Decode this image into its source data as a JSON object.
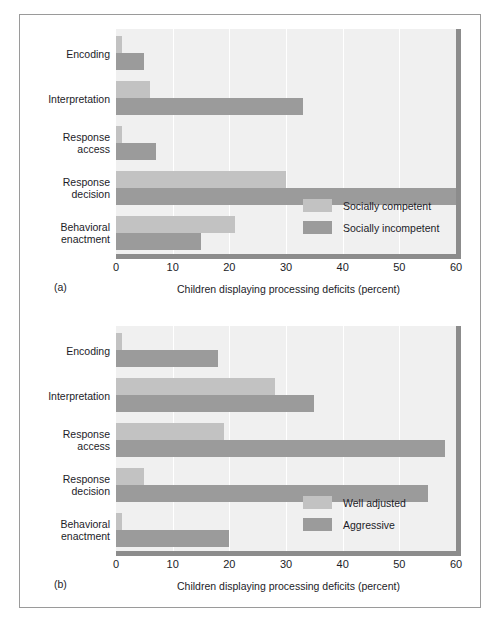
{
  "chart_data": [
    {
      "type": "bar",
      "orientation": "horizontal",
      "panel": "(a)",
      "title": "",
      "xlabel": "Children displaying processing deficits (percent)",
      "ylabel": "",
      "xlim": [
        0,
        60
      ],
      "xticks": [
        0,
        10,
        20,
        30,
        40,
        50,
        60
      ],
      "grid": true,
      "legend_position": "inside-lower-right",
      "categories": [
        "Encoding",
        "Interpretation",
        "Response access",
        "Response decision",
        "Behavioral enactment"
      ],
      "series": [
        {
          "name": "Socially competent",
          "color": "#c2c2c2",
          "values": [
            1,
            6,
            1,
            30,
            21
          ]
        },
        {
          "name": "Socially incompetent",
          "color": "#9b9b9b",
          "values": [
            5,
            33,
            7,
            60,
            15
          ]
        }
      ]
    },
    {
      "type": "bar",
      "orientation": "horizontal",
      "panel": "(b)",
      "title": "",
      "xlabel": "Children displaying processing deficits (percent)",
      "ylabel": "",
      "xlim": [
        0,
        60
      ],
      "xticks": [
        0,
        10,
        20,
        30,
        40,
        50,
        60
      ],
      "grid": true,
      "legend_position": "inside-lower-right",
      "categories": [
        "Encoding",
        "Interpretation",
        "Response access",
        "Response decision",
        "Behavioral enactment"
      ],
      "series": [
        {
          "name": "Well adjusted",
          "color": "#c2c2c2",
          "values": [
            1,
            28,
            19,
            5,
            1
          ]
        },
        {
          "name": "Aggressive",
          "color": "#9b9b9b",
          "values": [
            18,
            35,
            58,
            55,
            20
          ]
        }
      ]
    }
  ],
  "figure": {
    "panels": [
      {
        "tag": "(a)",
        "xlabel": "Children displaying processing deficits (percent)",
        "xticks": [
          "0",
          "10",
          "20",
          "30",
          "40",
          "50",
          "60"
        ],
        "categories": [
          {
            "line1": "Encoding",
            "line2": ""
          },
          {
            "line1": "Interpretation",
            "line2": ""
          },
          {
            "line1": "Response",
            "line2": "access"
          },
          {
            "line1": "Response",
            "line2": "decision"
          },
          {
            "line1": "Behavioral",
            "line2": "enactment"
          }
        ],
        "legend": [
          {
            "label": "Socially competent",
            "color": "#c2c2c2"
          },
          {
            "label": "Socially incompetent",
            "color": "#9b9b9b"
          }
        ]
      },
      {
        "tag": "(b)",
        "xlabel": "Children displaying processing deficits (percent)",
        "xticks": [
          "0",
          "10",
          "20",
          "30",
          "40",
          "50",
          "60"
        ],
        "categories": [
          {
            "line1": "Encoding",
            "line2": ""
          },
          {
            "line1": "Interpretation",
            "line2": ""
          },
          {
            "line1": "Response",
            "line2": "access"
          },
          {
            "line1": "Response",
            "line2": "decision"
          },
          {
            "line1": "Behavioral",
            "line2": "enactment"
          }
        ],
        "legend": [
          {
            "label": "Well adjusted",
            "color": "#c2c2c2"
          },
          {
            "label": "Aggressive",
            "color": "#9b9b9b"
          }
        ]
      }
    ],
    "colors": {
      "plot_background": "#f0f0f0",
      "axis_shadow": "#8c8c8c",
      "border": "#9a9a9a",
      "text": "#1c1c28"
    }
  }
}
